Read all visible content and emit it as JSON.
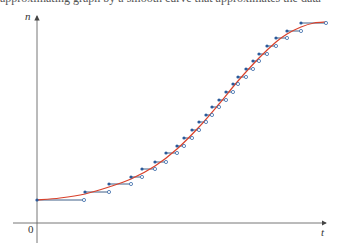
{
  "caption_fragment": "approximating graph by a smooth curve that approximates the data",
  "axes": {
    "x_label": "t",
    "y_label": "n",
    "origin_label": "0",
    "x_axis_color": "#666666",
    "y_axis_color": "#666666"
  },
  "colors": {
    "curve": "#d9412b",
    "step_line": "#2b4f7a",
    "step_dot": "#2b5a9a",
    "open_dot_stroke": "#3a6aa8"
  },
  "chart_data": {
    "type": "line",
    "title": "",
    "xlabel": "t",
    "ylabel": "n",
    "grid": false,
    "legend": false,
    "series": [
      {
        "name": "step-data",
        "style": "step",
        "steps_px": [
          [
            37,
            84,
            200
          ],
          [
            85,
            109,
            192
          ],
          [
            109,
            131,
            184
          ],
          [
            131,
            142,
            177
          ],
          [
            142,
            155,
            169
          ],
          [
            155,
            166,
            162
          ],
          [
            166,
            177,
            153
          ],
          [
            177,
            184,
            146
          ],
          [
            184,
            192,
            138
          ],
          [
            192,
            199,
            130
          ],
          [
            199,
            206,
            122
          ],
          [
            206,
            212,
            115
          ],
          [
            212,
            219,
            107
          ],
          [
            219,
            226,
            100
          ],
          [
            226,
            233,
            92
          ],
          [
            233,
            238,
            84
          ],
          [
            238,
            246,
            77
          ],
          [
            246,
            253,
            69
          ],
          [
            253,
            259,
            61
          ],
          [
            259,
            267,
            54
          ],
          [
            267,
            276,
            46
          ],
          [
            276,
            287,
            38
          ],
          [
            287,
            301,
            31
          ],
          [
            301,
            326,
            23
          ]
        ]
      },
      {
        "name": "smooth-approximation",
        "style": "curve",
        "points_px": [
          [
            37,
            200
          ],
          [
            60,
            198
          ],
          [
            85,
            194
          ],
          [
            109,
            187
          ],
          [
            131,
            179
          ],
          [
            155,
            166
          ],
          [
            177,
            149
          ],
          [
            199,
            127
          ],
          [
            219,
            104
          ],
          [
            238,
            81
          ],
          [
            259,
            58
          ],
          [
            276,
            42
          ],
          [
            287,
            34
          ],
          [
            301,
            27
          ],
          [
            314,
            23
          ],
          [
            326,
            22
          ]
        ]
      }
    ]
  }
}
